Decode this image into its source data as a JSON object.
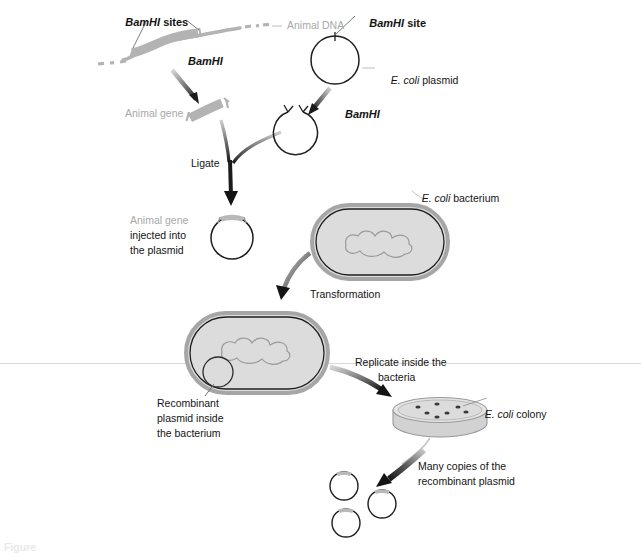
{
  "figure": {
    "background_color": "#ffffff",
    "ink_color": "#141414",
    "grey_label_color": "#a8a8a8",
    "dna_grey": "#b3b3b3",
    "cell_fill": "#dcdcdc",
    "cell_wall": "#a6a6a6"
  },
  "labels": {
    "bamhi_sites": {
      "enzyme": "BamHI",
      "rest": " sites"
    },
    "animal_dna": "Animal DNA",
    "bamhi_cut_animal": "BamHI",
    "animal_gene": "Animal gene",
    "ligate": "Ligate",
    "bamhi_site": {
      "enzyme": "BamHI",
      "rest": " site"
    },
    "ecoli_plasmid": {
      "italic": "E. coli",
      "rest": " plasmid"
    },
    "bamhi_cut_plasmid": "BamHI",
    "injected_grey": "Animal gene",
    "injected_black_line1": "injected into",
    "injected_black_line2": "the plasmid",
    "ecoli_bacterium": {
      "italic": "E. coli",
      "rest": " bacterium"
    },
    "transformation": "Transformation",
    "recombinant_line1": "Recombinant",
    "recombinant_line2": "plasmid inside",
    "recombinant_line3": "the bacterium",
    "replicate_line1": "Replicate inside the",
    "replicate_line2": "bacteria",
    "ecoli_colony": {
      "italic": "E. coli",
      "rest": " colony"
    },
    "many_copies_line1": "Many copies of the",
    "many_copies_line2": "recombinant plasmid"
  },
  "caption": {
    "text": "Figure"
  },
  "diagram_elements": {
    "animal_dna_strand": "wavy-grey-dna-strand-with-gene-segment",
    "cut_gene_fragment": "grey-fragment-with-sticky-ends",
    "intact_plasmid": "open-circle-with-single-cut-site",
    "cut_plasmid": "open-circle-with-two-sticky-ends",
    "recombinant_plasmid": "circle-with-grey-gene-insert",
    "bacterium_1": "stadium-cell-with-nucleoid",
    "bacterium_2": "stadium-cell-with-nucleoid-and-plasmid",
    "petri_dish": "dish-with-seven-colonies",
    "plasmid_copies_count": 3
  }
}
